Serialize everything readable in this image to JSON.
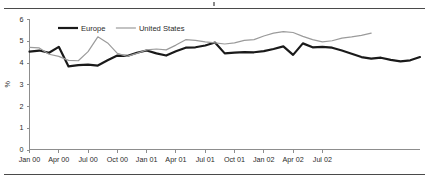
{
  "figure": {
    "has_top_rule": true,
    "has_bottom_rule": true,
    "clipped_title_fragment": ""
  },
  "legend": {
    "position": "top-left-inside",
    "entries": [
      {
        "label": "Europe",
        "color": "#1a1a1a",
        "width": 2.2
      },
      {
        "label": "United States",
        "color": "#9b9b9b",
        "width": 1.2
      }
    ]
  },
  "axes": {
    "y_title": "%",
    "y_ticks": [
      "0",
      "1",
      "2",
      "3",
      "4",
      "5",
      "6"
    ],
    "x_ticks": [
      "Jan 00",
      "Apr 00",
      "Jul 00",
      "Oct 00",
      "Jan 01",
      "Apr 01",
      "Jul 01",
      "Oct 01",
      "Jan 02",
      "Apr 02",
      "Jul 02"
    ]
  },
  "chart_data": {
    "type": "line",
    "title": "",
    "subtitle": "",
    "xlabel": "",
    "ylabel": "%",
    "ylim": [
      0,
      6
    ],
    "ytick_step": 1,
    "grid": false,
    "legend_position": "top-left",
    "x": [
      "Jan 00",
      "Feb 00",
      "Mar 00",
      "Apr 00",
      "May 00",
      "Jun 00",
      "Jul 00",
      "Aug 00",
      "Sep 00",
      "Oct 00",
      "Nov 00",
      "Dec 00",
      "Jan 01",
      "Feb 01",
      "Mar 01",
      "Apr 01",
      "May 01",
      "Jun 01",
      "Jul 01",
      "Aug 01",
      "Sep 01",
      "Oct 01",
      "Nov 01",
      "Dec 01",
      "Jan 02",
      "Feb 02",
      "Mar 02",
      "Apr 02",
      "May 02",
      "Jun 02",
      "Jul 02",
      "Aug 02",
      "Sep 02"
    ],
    "x_tick_labels": [
      "Jan 00",
      "Apr 00",
      "Jul 00",
      "Oct 00",
      "Jan 01",
      "Apr 01",
      "Jul 01",
      "Oct 01",
      "Jan 02",
      "Apr 02",
      "Jul 02"
    ],
    "x_tick_every": 3,
    "series": [
      {
        "name": "Europe",
        "color": "#1a1a1a",
        "values": [
          4.5,
          4.55,
          4.45,
          4.72,
          3.82,
          3.88,
          3.9,
          3.86,
          4.1,
          4.32,
          4.3,
          4.45,
          4.55,
          4.42,
          4.32,
          4.52,
          4.68,
          4.7,
          4.78,
          4.92,
          4.42,
          4.45,
          4.48,
          4.47,
          4.52,
          4.62,
          4.74,
          4.35,
          4.88,
          4.7,
          4.72,
          4.68,
          4.55
        ]
      },
      {
        "name": "United States",
        "color": "#9b9b9b",
        "values": [
          4.7,
          4.67,
          4.38,
          4.28,
          4.1,
          4.08,
          4.5,
          5.18,
          4.9,
          4.42,
          4.28,
          4.42,
          4.58,
          4.62,
          4.58,
          4.8,
          5.05,
          5.02,
          4.95,
          4.9,
          4.85,
          4.9,
          5.02,
          5.05,
          5.22,
          5.35,
          5.42,
          5.38,
          5.2,
          5.05,
          4.95,
          5.0,
          5.12
        ]
      }
    ],
    "series_tail": {
      "Europe": [
        4.4,
        4.25,
        4.18,
        4.22,
        4.12,
        4.05,
        4.1,
        4.25
      ],
      "United States": [
        5.18,
        5.25,
        5.35
      ]
    }
  }
}
